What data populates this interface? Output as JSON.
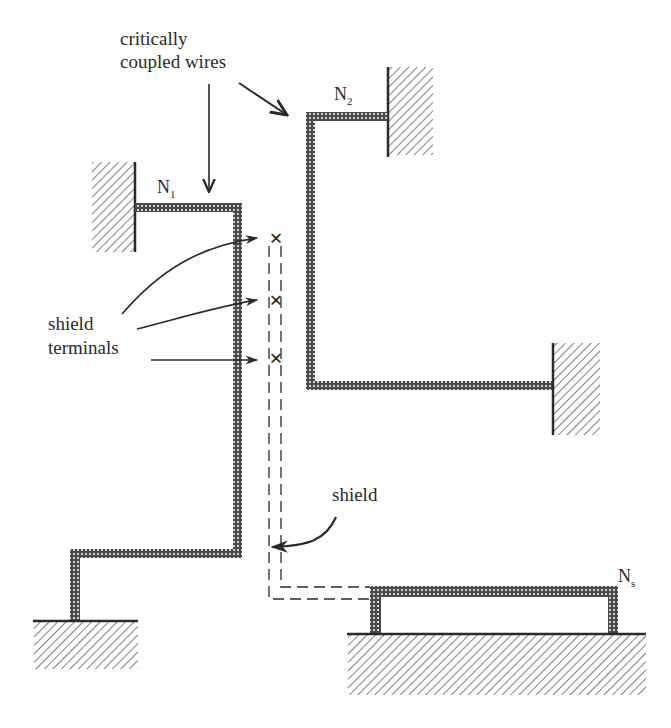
{
  "diagram": {
    "labels": {
      "coupled_line1": "critically",
      "coupled_line2": "coupled wires",
      "shield_terminals_line1": "shield",
      "shield_terminals_line2": "terminals",
      "shield": "shield"
    },
    "nodes": [
      {
        "id": "N1",
        "name": "N",
        "subscript": "1"
      },
      {
        "id": "N2",
        "name": "N",
        "subscript": "2"
      },
      {
        "id": "Ns",
        "name": "N",
        "subscript": "s"
      }
    ],
    "terminal_marker": "×",
    "colors": {
      "wire_fill": "#4a4a4a",
      "wire_dots": "#ffffff",
      "hatch": "#3a3a3a",
      "line": "#2a2a2a",
      "background": "#ffffff"
    }
  }
}
